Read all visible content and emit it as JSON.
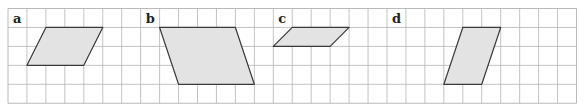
{
  "grid": {
    "origin_x": 8,
    "origin_y": 8.5,
    "cell": 18.95,
    "cols": 30,
    "rows": 5,
    "line_color": "#b4b4b4",
    "border_color": "#a8a8a8"
  },
  "style": {
    "fill": "#e3e3e3",
    "stroke": "#3a3a3a"
  },
  "panels": [
    {
      "label": "a",
      "label_col": 0,
      "shape": [
        [
          2,
          1
        ],
        [
          5,
          1
        ],
        [
          4,
          3
        ],
        [
          1,
          3
        ]
      ]
    },
    {
      "label": "b",
      "label_col": 7,
      "shape": [
        [
          8,
          1
        ],
        [
          12,
          1
        ],
        [
          13,
          4
        ],
        [
          9,
          4
        ]
      ]
    },
    {
      "label": "c",
      "label_col": 14,
      "shape": [
        [
          15,
          1
        ],
        [
          18,
          1
        ],
        [
          17,
          2
        ],
        [
          14,
          2
        ]
      ]
    },
    {
      "label": "d",
      "label_col": 20,
      "shape": [
        [
          24,
          1
        ],
        [
          26,
          1
        ],
        [
          25,
          4
        ],
        [
          23,
          4
        ]
      ]
    }
  ]
}
